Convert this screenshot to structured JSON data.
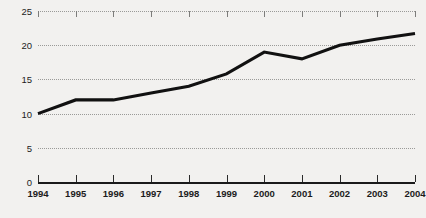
{
  "chart_data": {
    "type": "line",
    "title": "",
    "subtitle": "",
    "xlabel": "",
    "ylabel": "",
    "categories": [
      "1994",
      "1995",
      "1996",
      "1997",
      "1998",
      "1999",
      "2000",
      "2001",
      "2002",
      "2003",
      "2004"
    ],
    "values": [
      10.0,
      12.0,
      12.0,
      13.0,
      14.0,
      15.8,
      19.0,
      18.0,
      20.0,
      20.9,
      21.7
    ],
    "series": [
      {
        "name": "series-1",
        "values": [
          10.0,
          12.0,
          12.0,
          13.0,
          14.0,
          15.8,
          19.0,
          18.0,
          20.0,
          20.9,
          21.7
        ]
      }
    ],
    "xlim": [
      1994,
      2004
    ],
    "ylim": [
      0,
      25
    ],
    "yticks": [
      0,
      5,
      10,
      15,
      20,
      25
    ],
    "ytick_labels": [
      "0",
      "5",
      "10",
      "15",
      "20",
      "25"
    ],
    "xticks": [
      "1994",
      "1995",
      "1996",
      "1997",
      "1998",
      "1999",
      "2000",
      "2001",
      "2002",
      "2003",
      "2004"
    ],
    "grid": true,
    "grid_style": "dotted",
    "legend": false,
    "legend_position": "none",
    "colors": {
      "line": "#111111",
      "grid": "#9a9a98",
      "axis": "#1a1a1a",
      "text": "#1c1c1c",
      "background": "#f2f1ef"
    }
  }
}
